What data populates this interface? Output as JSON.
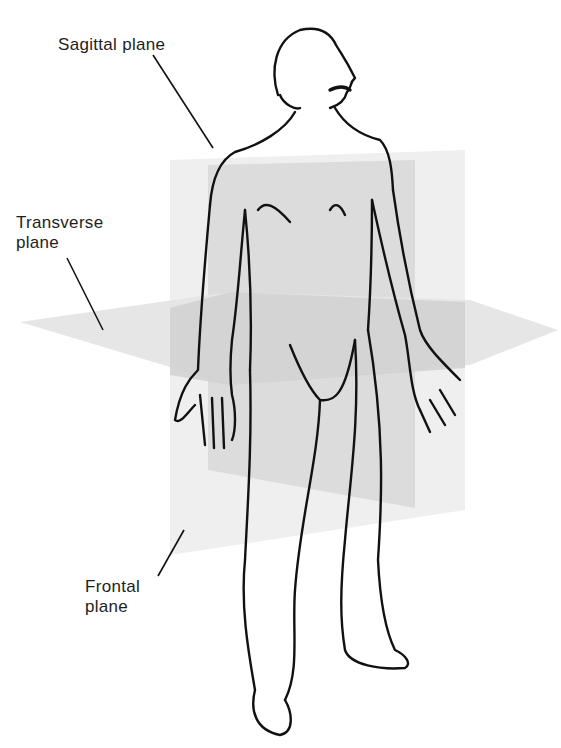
{
  "figure": {
    "labels": {
      "sagittal": "Sagittal plane",
      "transverse_line1": "Transverse",
      "transverse_line2": "plane",
      "frontal_line1": "Frontal",
      "frontal_line2": "plane"
    },
    "colors": {
      "background": "#ffffff",
      "outline": "#111111",
      "plane_light": "#ececec",
      "plane_mid": "#dcdcdc",
      "plane_dark": "#c8c8c8",
      "label_text": "#1e1e1e"
    }
  }
}
